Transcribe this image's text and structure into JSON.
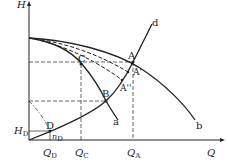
{
  "figure": {
    "axes": {
      "y_label": "H",
      "x_label": "Q"
    },
    "curves": {
      "outer": "b",
      "inner": "a",
      "system": "d"
    },
    "points": {
      "A": "A",
      "A_prime": "A'",
      "A_double_prime": "A''",
      "B": "B",
      "C": "C",
      "D": "D"
    },
    "ticks": {
      "QD": {
        "main": "Q",
        "sub": "D"
      },
      "QC": {
        "main": "Q",
        "sub": "C"
      },
      "QA": {
        "main": "Q",
        "sub": "A"
      },
      "HD": {
        "main": "H",
        "sub": "D"
      },
      "nD": {
        "main": "n",
        "sub": "D"
      }
    },
    "colors": {
      "line": "#222222",
      "background": "#ffffff"
    }
  }
}
